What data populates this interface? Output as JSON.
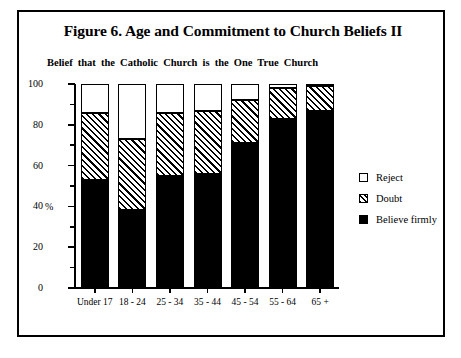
{
  "figure": {
    "title": "Figure 6. Age and Commitment to Church Beliefs II",
    "subtitle": "Belief that the Catholic Church is the One True Church"
  },
  "chart_data": {
    "type": "bar",
    "stacked": true,
    "title": "Figure 6. Age and Commitment to Church Beliefs II",
    "subtitle": "Belief that the Catholic Church is the One True Church",
    "xlabel": "",
    "ylabel": "%",
    "ylim": [
      0,
      100
    ],
    "yticks": [
      0,
      20,
      40,
      60,
      80,
      100
    ],
    "ytick_labels": [
      "0",
      "20",
      "40",
      "60",
      "80",
      "100"
    ],
    "yminor_ticks": [
      10,
      30,
      50,
      70,
      90
    ],
    "grid": false,
    "legend_position": "right",
    "categories": [
      "Under 17",
      "18 - 24",
      "25 - 34",
      "35 - 44",
      "45 - 54",
      "55 - 64",
      "65 +"
    ],
    "series": [
      {
        "name": "Believe firmly",
        "fill": "solid-black",
        "color": "#000000",
        "values": [
          53,
          38,
          55,
          56,
          71,
          83,
          87
        ]
      },
      {
        "name": "Doubt",
        "fill": "diagonal-hatch",
        "color": "#000000",
        "values": [
          33,
          35,
          31,
          31,
          21,
          15,
          12
        ]
      },
      {
        "name": "Reject",
        "fill": "white",
        "color": "#ffffff",
        "values": [
          14,
          27,
          14,
          13,
          8,
          2,
          1
        ]
      }
    ],
    "stack_order_bottom_to_top": [
      "Believe firmly",
      "Doubt",
      "Reject"
    ]
  },
  "legend": {
    "items": [
      {
        "label": "Reject"
      },
      {
        "label": "Doubt"
      },
      {
        "label": "Believe firmly"
      }
    ]
  }
}
